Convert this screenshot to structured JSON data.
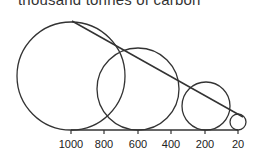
{
  "title": "thousand tonnes of carbon",
  "chart_data": {
    "type": "bubble-scale",
    "title": "thousand tonnes of carbon",
    "axis": {
      "ticks": [
        {
          "label": "1000",
          "x": 71
        },
        {
          "label": "800",
          "x": 104
        },
        {
          "label": "600",
          "x": 138
        },
        {
          "label": "400",
          "x": 171
        },
        {
          "label": "200",
          "x": 205
        },
        {
          "label": "20",
          "x": 238
        }
      ]
    },
    "circles": [
      {
        "value": 1000,
        "cx": 71,
        "cy": 76,
        "r": 54
      },
      {
        "value": 600,
        "cx": 138,
        "cy": 89,
        "r": 41
      },
      {
        "value": 200,
        "cx": 206,
        "cy": 106,
        "r": 24
      },
      {
        "value": 20,
        "cx": 238,
        "cy": 122,
        "r": 8
      }
    ],
    "envelope_line": {
      "x1": 72,
      "y1": 21,
      "x2": 243,
      "y2": 117
    },
    "baseline": {
      "x1": 71,
      "x2": 238,
      "y": 130
    },
    "stroke_color": "#333333"
  }
}
